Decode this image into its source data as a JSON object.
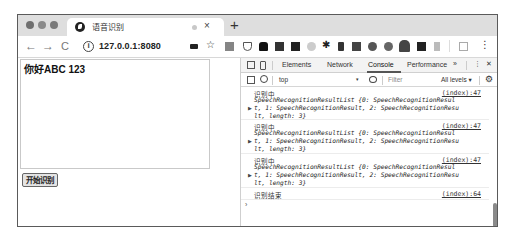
{
  "browser": {
    "tab": {
      "title": "语音识别",
      "favicon": "globe-icon",
      "close": "×"
    },
    "new_tab": "+",
    "nav": {
      "back": "←",
      "forward": "→",
      "reload": "C"
    },
    "address": {
      "info_icon": "i",
      "url": "127.0.0.1:8080"
    },
    "toolbar_icons": [
      "camera-icon",
      "star-icon",
      "qr-icon",
      "pocket-icon",
      "extension-1-icon",
      "extension-2-icon",
      "extension-3-icon",
      "extension-4-icon",
      "extension-5-icon",
      "extension-6-icon",
      "extension-7-icon",
      "extension-8-icon",
      "extension-9-icon",
      "extension-10-icon",
      "extension-11-icon",
      "extension-12-icon",
      "extensions-puzzle-icon",
      "menu-kebab-icon"
    ],
    "menu": "⋮"
  },
  "page": {
    "textarea_value": "你好ABC 123",
    "start_button": "开始识别"
  },
  "devtools": {
    "tabs": [
      {
        "label": "Elements"
      },
      {
        "label": "Network"
      },
      {
        "label": "Console",
        "active": true
      },
      {
        "label": "Performance"
      }
    ],
    "more_tabs": "»",
    "kebab": "⋮",
    "close": "✕",
    "context": "top",
    "context_arrow": "▾",
    "filter_placeholder": "Filter",
    "levels": "All levels ▾",
    "logs": [
      {
        "message": "识别中",
        "source": "(index):47",
        "object_lines": [
          "SpeechRecognitionResultList {0: SpeechRecognitionResul",
          "t, 1: SpeechRecognitionResult, 2: SpeechRecognitionResu",
          "lt, length: 3}"
        ]
      },
      {
        "message": "识别中",
        "source": "(index):47",
        "object_lines": [
          "SpeechRecognitionResultList {0: SpeechRecognitionResul",
          "t, 1: SpeechRecognitionResult, 2: SpeechRecognitionResu",
          "lt, length: 3}"
        ]
      },
      {
        "message": "识别中",
        "source": "(index):47",
        "object_lines": [
          "SpeechRecognitionResultList {0: SpeechRecognitionResul",
          "t, 1: SpeechRecognitionResult, 2: SpeechRecognitionResu",
          "lt, length: 3}"
        ]
      },
      {
        "message": "识别结束",
        "source": "(index):64"
      }
    ],
    "prompt": "›"
  }
}
